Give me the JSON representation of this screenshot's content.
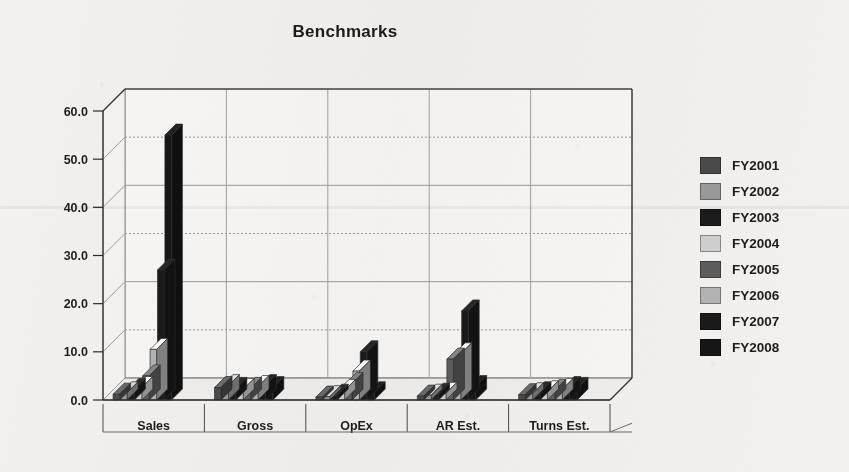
{
  "chart_data": {
    "type": "bar",
    "title": "Benchmarks",
    "xlabel": "",
    "ylabel": "",
    "ylim": [
      0,
      60
    ],
    "ytick_step": 10,
    "ytick_labels": [
      "0.0",
      "10.0",
      "20.0",
      "30.0",
      "40.0",
      "50.0",
      "60.0"
    ],
    "grid": true,
    "legend_position": "right",
    "style": "3d-grouped-bar",
    "categories": [
      "Sales",
      "Gross",
      "OpEx",
      "AR Est.",
      "Turns Est."
    ],
    "series": [
      {
        "name": "FY2001",
        "color": "#4a4a4a",
        "values": [
          1.2,
          2.6,
          0.6,
          0.8,
          1.1
        ]
      },
      {
        "name": "FY2002",
        "color": "#9a9a9a",
        "values": [
          1.5,
          3.0,
          0.7,
          1.0,
          1.3
        ]
      },
      {
        "name": "FY2003",
        "color": "#1c1c1c",
        "values": [
          2.2,
          2.4,
          1.0,
          1.2,
          1.5
        ]
      },
      {
        "name": "FY2004",
        "color": "#cfcfcf",
        "values": [
          2.6,
          2.2,
          2.0,
          1.4,
          1.7
        ]
      },
      {
        "name": "FY2005",
        "color": "#5d5d5d",
        "values": [
          5.0,
          2.4,
          3.4,
          8.5,
          2.0
        ]
      },
      {
        "name": "FY2006",
        "color": "#b4b4b4",
        "values": [
          10.5,
          2.8,
          6.0,
          9.6,
          2.2
        ]
      },
      {
        "name": "FY2007",
        "color": "#1a1a1a",
        "values": [
          27.0,
          3.0,
          10.0,
          18.5,
          2.6
        ]
      },
      {
        "name": "FY2008",
        "color": "#161616",
        "values": [
          55.0,
          2.6,
          1.5,
          2.8,
          2.4
        ]
      }
    ]
  },
  "legend": {
    "items": [
      {
        "label": "FY2001",
        "color": "#4a4a4a"
      },
      {
        "label": "FY2002",
        "color": "#9a9a9a"
      },
      {
        "label": "FY2003",
        "color": "#1c1c1c"
      },
      {
        "label": "FY2004",
        "color": "#cfcfcf"
      },
      {
        "label": "FY2005",
        "color": "#5d5d5d"
      },
      {
        "label": "FY2006",
        "color": "#b4b4b4"
      },
      {
        "label": "FY2007",
        "color": "#1a1a1a"
      },
      {
        "label": "FY2008",
        "color": "#161616"
      }
    ]
  }
}
